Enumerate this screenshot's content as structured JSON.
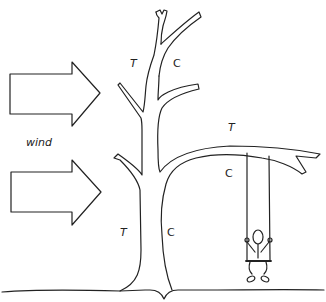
{
  "diagram": {
    "type": "illustration",
    "colors": {
      "stroke": "#222222",
      "background": "#ffffff"
    },
    "wind": {
      "label": "wind",
      "arrows": [
        {
          "id": "upper-wind-arrow"
        },
        {
          "id": "lower-wind-arrow"
        }
      ]
    },
    "labels": {
      "upper_branch_T": "T",
      "upper_branch_C": "C",
      "side_branch_T": "T",
      "side_branch_C": "C",
      "trunk_T": "T",
      "trunk_C": "C"
    },
    "elements": [
      "tree-trunk",
      "upper-branches",
      "long-side-branch",
      "swing",
      "child-figure",
      "ground-line"
    ]
  }
}
